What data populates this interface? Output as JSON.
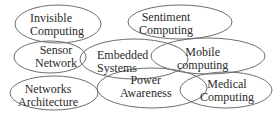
{
  "diagram": {
    "type": "overlapping-ellipses",
    "nodes": [
      {
        "id": "invisible-computing",
        "line1": "Invisible",
        "line2": "Computing"
      },
      {
        "id": "sentiment-computing",
        "line1": "Sentiment",
        "line2": "Computing"
      },
      {
        "id": "sensor-network",
        "line1": "Sensor",
        "line2": "Network"
      },
      {
        "id": "embedded-systems",
        "line1": "Embedded",
        "line2": "Systems"
      },
      {
        "id": "mobile-computing",
        "line1": "Mobile",
        "line2": "computing"
      },
      {
        "id": "networks-architecture",
        "line1": "Networks",
        "line2": "Architecture"
      },
      {
        "id": "power-awareness",
        "line1": "Power",
        "line2": "Awareness"
      },
      {
        "id": "medical-computing",
        "line1": "Medical",
        "line2": "Computing"
      }
    ],
    "colors": {
      "stroke": "#6e6e6e",
      "fill": "#ffffff",
      "text": "#2a2a2a"
    }
  }
}
